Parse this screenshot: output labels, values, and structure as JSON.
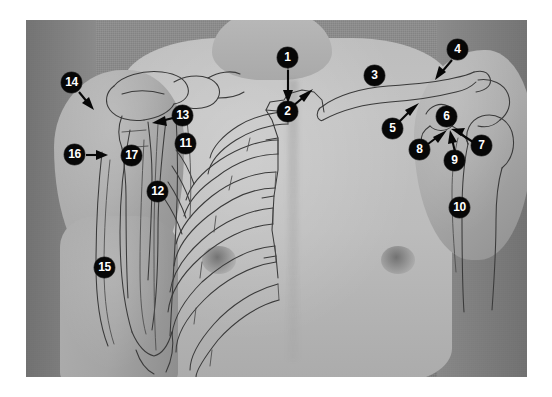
{
  "figure": {
    "image_type": "grayscale anatomical photograph with line-drawing overlay",
    "background_color": "#ffffff",
    "plate_bounds": {
      "left": 26,
      "top": 20,
      "width": 501,
      "height": 357
    },
    "backdrop_color": "#868686",
    "skin_color": "#bdbdbd",
    "overlay_line_color": "#3a3a3a",
    "label_circle_color": "#070707",
    "label_text_color": "#ffffff"
  },
  "labels": [
    {
      "id": "1",
      "text": "1",
      "x": 288,
      "y": 58,
      "arrow": true,
      "arrow_to": {
        "x": 297,
        "y": 96
      },
      "region": "sternoclavicular-joint"
    },
    {
      "id": "2",
      "text": "2",
      "x": 288,
      "y": 112,
      "arrow": true,
      "arrow_to": {
        "x": 310,
        "y": 96
      },
      "region": "manubrium"
    },
    {
      "id": "3",
      "text": "3",
      "x": 375,
      "y": 76,
      "arrow": false,
      "arrow_to": null,
      "region": "clavicle"
    },
    {
      "id": "4",
      "text": "4",
      "x": 458,
      "y": 50,
      "arrow": true,
      "arrow_to": {
        "x": 437,
        "y": 78
      },
      "region": "acromion"
    },
    {
      "id": "5",
      "text": "5",
      "x": 393,
      "y": 129,
      "arrow": true,
      "arrow_to": {
        "x": 414,
        "y": 106
      },
      "region": "coracoid-process"
    },
    {
      "id": "6",
      "text": "6",
      "x": 447,
      "y": 117,
      "arrow": false,
      "arrow_to": null,
      "region": "head-of-humerus"
    },
    {
      "id": "7",
      "text": "7",
      "x": 482,
      "y": 146,
      "arrow": true,
      "arrow_to": {
        "x": 456,
        "y": 130
      },
      "region": "deltoid-muscle"
    },
    {
      "id": "8",
      "text": "8",
      "x": 420,
      "y": 150,
      "arrow": true,
      "arrow_to": {
        "x": 440,
        "y": 133
      },
      "region": "pectoralis-major"
    },
    {
      "id": "9",
      "text": "9",
      "x": 455,
      "y": 161,
      "arrow": true,
      "arrow_to": {
        "x": 450,
        "y": 137
      },
      "region": "deltopectoral-groove"
    },
    {
      "id": "10",
      "text": "10",
      "x": 460,
      "y": 208,
      "arrow": false,
      "arrow_to": null,
      "region": "lateral-arm"
    },
    {
      "id": "11",
      "text": "11",
      "x": 186,
      "y": 144,
      "arrow": false,
      "arrow_to": null,
      "region": "axilla"
    },
    {
      "id": "12",
      "text": "12",
      "x": 158,
      "y": 192,
      "arrow": false,
      "arrow_to": null,
      "region": "serratus-anterior"
    },
    {
      "id": "13",
      "text": "13",
      "x": 183,
      "y": 116,
      "arrow": true,
      "arrow_to": {
        "x": 156,
        "y": 122
      },
      "region": "coracobrachialis"
    },
    {
      "id": "14",
      "text": "14",
      "x": 72,
      "y": 83,
      "arrow": true,
      "arrow_to": {
        "x": 90,
        "y": 106
      },
      "region": "deltoid-insertion"
    },
    {
      "id": "15",
      "text": "15",
      "x": 105,
      "y": 268,
      "arrow": false,
      "arrow_to": null,
      "region": "biceps-brachii"
    },
    {
      "id": "16",
      "text": "16",
      "x": 75,
      "y": 155,
      "arrow": true,
      "arrow_to": {
        "x": 104,
        "y": 155
      },
      "region": "triceps-brachii"
    },
    {
      "id": "17",
      "text": "17",
      "x": 132,
      "y": 156,
      "arrow": false,
      "arrow_to": null,
      "region": "brachial-artery"
    }
  ]
}
